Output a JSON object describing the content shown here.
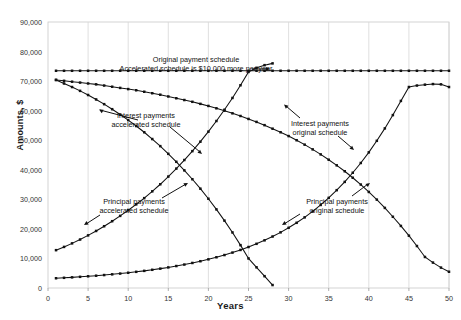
{
  "chart_data": {
    "type": "line",
    "title": "",
    "xlabel": "Years",
    "ylabel": "Amounts, $",
    "xlim": [
      0,
      50
    ],
    "ylim": [
      0,
      90000
    ],
    "xticks": [
      0,
      5,
      10,
      15,
      20,
      25,
      30,
      35,
      40,
      45,
      50
    ],
    "xticklabels": [
      "0",
      "5",
      "10",
      "15",
      "20",
      "25",
      "30",
      "35",
      "40",
      "45",
      "50"
    ],
    "yticks": [
      0,
      10000,
      20000,
      30000,
      40000,
      50000,
      60000,
      70000,
      80000,
      90000
    ],
    "yticklabels": [
      "0",
      "10,000",
      "20,000",
      "30,000",
      "40,000",
      "50,000",
      "60,000",
      "70,000",
      "80,000",
      "90,000"
    ],
    "grid": "vertical-only",
    "grid_color": "#d8d8d8",
    "line_color": "#111111",
    "marker": "square",
    "legend": "none (labels annotated inline)",
    "series": [
      {
        "name": "Accelerated schedule total payment",
        "annotation": "Original payment schedule / Accelerated schedule is $10,000 more per year",
        "x": [
          1,
          2,
          3,
          4,
          5,
          6,
          7,
          8,
          9,
          10,
          11,
          12,
          13,
          14,
          15,
          16,
          17,
          18,
          19,
          20,
          21,
          22,
          23,
          24,
          25,
          26,
          27,
          28,
          29,
          30,
          31,
          32,
          33,
          34,
          35,
          36,
          37,
          38,
          39,
          40,
          41,
          42,
          43,
          44,
          45,
          46,
          47,
          48,
          49,
          50
        ],
        "values": [
          73500,
          73500,
          73500,
          73500,
          73500,
          73500,
          73500,
          73500,
          73500,
          73500,
          73500,
          73500,
          73500,
          73500,
          73500,
          73500,
          73500,
          73500,
          73500,
          73500,
          73500,
          73500,
          73500,
          73500,
          73500,
          73500,
          73500,
          73500,
          73500,
          73500,
          73500,
          73500,
          73500,
          73500,
          73500,
          73500,
          73500,
          73500,
          73500,
          73500,
          73500,
          73500,
          73500,
          73500,
          73500,
          73500,
          73500,
          73500,
          73500,
          73500
        ]
      },
      {
        "name": "Interest payments original schedule",
        "annotation": "Interest payments original schedule",
        "x": [
          1,
          2,
          3,
          4,
          5,
          6,
          7,
          8,
          9,
          10,
          11,
          12,
          13,
          14,
          15,
          16,
          17,
          18,
          19,
          20,
          21,
          22,
          23,
          24,
          25,
          26,
          27,
          28,
          29,
          30,
          31,
          32,
          33,
          34,
          35,
          36,
          37,
          38,
          39,
          40,
          41,
          42,
          43,
          44,
          45,
          46,
          47,
          48,
          49,
          50
        ],
        "values": [
          70400,
          70100,
          69800,
          69500,
          69200,
          68900,
          68500,
          68100,
          67700,
          67300,
          66900,
          66400,
          65900,
          65400,
          64800,
          64200,
          63600,
          63000,
          62300,
          61600,
          60800,
          60000,
          59100,
          58200,
          57200,
          56200,
          55100,
          53900,
          52700,
          51400,
          50000,
          48500,
          46900,
          45200,
          43400,
          41500,
          39500,
          37300,
          35000,
          32500,
          29900,
          27100,
          24100,
          21000,
          17700,
          14200,
          10500,
          8600,
          6900,
          5500
        ]
      },
      {
        "name": "Principal payments original schedule",
        "annotation": "Principal payments original schedule",
        "x": [
          1,
          2,
          3,
          4,
          5,
          6,
          7,
          8,
          9,
          10,
          11,
          12,
          13,
          14,
          15,
          16,
          17,
          18,
          19,
          20,
          21,
          22,
          23,
          24,
          25,
          26,
          27,
          28,
          29,
          30,
          31,
          32,
          33,
          34,
          35,
          36,
          37,
          38,
          39,
          40,
          41,
          42,
          43,
          44,
          45,
          46,
          47,
          48,
          49,
          50
        ],
        "values": [
          3300,
          3450,
          3600,
          3780,
          3960,
          4160,
          4380,
          4620,
          4880,
          5160,
          5470,
          5800,
          6160,
          6550,
          6970,
          7430,
          7930,
          8470,
          9060,
          9700,
          10400,
          11150,
          11980,
          12880,
          13870,
          14950,
          16130,
          17420,
          18830,
          20370,
          22060,
          23900,
          25900,
          28100,
          30500,
          33100,
          35900,
          39000,
          42300,
          45900,
          49800,
          54000,
          58500,
          63300,
          68000,
          68500,
          68800,
          69000,
          68900,
          68000
        ]
      },
      {
        "name": "Interest payments accelerated schedule",
        "annotation": "Interest payments accelerated schedule",
        "x": [
          1,
          2,
          3,
          4,
          5,
          6,
          7,
          8,
          9,
          10,
          11,
          12,
          13,
          14,
          15,
          16,
          17,
          18,
          19,
          20,
          21,
          22,
          23,
          24,
          25,
          26,
          27,
          28
        ],
        "values": [
          70400,
          69200,
          68000,
          66700,
          65300,
          63800,
          62200,
          60500,
          58700,
          56800,
          54800,
          52700,
          50400,
          48000,
          45400,
          42700,
          39800,
          36800,
          33600,
          30200,
          26600,
          22800,
          18800,
          14500,
          10000,
          7000,
          4000,
          1000
        ]
      },
      {
        "name": "Principal payments accelerated schedule",
        "annotation": "Principal payments accelerated schedule",
        "x": [
          1,
          2,
          3,
          4,
          5,
          6,
          7,
          8,
          9,
          10,
          11,
          12,
          13,
          14,
          15,
          16,
          17,
          18,
          19,
          20,
          21,
          22,
          23,
          24,
          25,
          26,
          27,
          28
        ],
        "values": [
          12800,
          13900,
          15100,
          16400,
          17800,
          19300,
          20900,
          22600,
          24400,
          26300,
          28300,
          30400,
          32700,
          35100,
          37700,
          40400,
          43300,
          46300,
          49500,
          52900,
          56500,
          60300,
          64300,
          68600,
          73100,
          74500,
          75400,
          76000
        ]
      }
    ],
    "annotations": [
      {
        "id": "accelerated-total-note",
        "line1": "Original payment schedule",
        "line2": "Accelerated schedule is $10,000 more per year",
        "has_arrow": true
      },
      {
        "id": "interest-accelerated-note",
        "line1": "Interest payments",
        "line2": "accelerated schedule",
        "has_arrow": true
      },
      {
        "id": "principal-accelerated-note",
        "line1": "Principal payments",
        "line2": "accelerated schedule",
        "has_arrow": true
      },
      {
        "id": "interest-original-note",
        "line1": "Interest payments",
        "line2": "original schedule",
        "has_arrow": true
      },
      {
        "id": "principal-original-note",
        "line1": "Principal payments",
        "line2": "original schedule",
        "has_arrow": true
      }
    ]
  }
}
